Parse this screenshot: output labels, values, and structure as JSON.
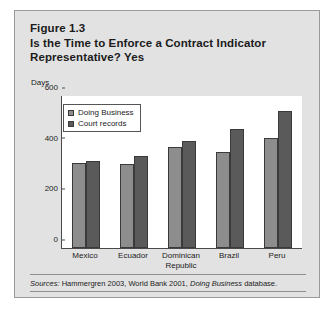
{
  "figure": {
    "title_lines": [
      "Figure 1.3",
      "Is the Time to Enforce a Contract Indicator",
      "Representative? Yes"
    ],
    "unit_label": "Days",
    "source_prefix": "Sources:",
    "source_text_1": " Hammergren 2003, World Bank 2001, ",
    "source_italic": "Doing Business",
    "source_text_2": " database."
  },
  "chart_data": {
    "type": "bar",
    "title": "Is the Time to Enforce a Contract Indicator Representative? Yes",
    "xlabel": "",
    "ylabel": "Days",
    "ylim": [
      0,
      600
    ],
    "yticks": [
      "0",
      "200",
      "400",
      "600"
    ],
    "grid": false,
    "legend_position": "inside-top-left",
    "categories": [
      "Mexico",
      "Ecuador",
      "Dominican Republic",
      "Brazil",
      "Peru"
    ],
    "category_lines": [
      [
        "Mexico"
      ],
      [
        "Ecuador"
      ],
      [
        "Dominican",
        "Republic"
      ],
      [
        "Brazil"
      ],
      [
        "Peru"
      ]
    ],
    "series": [
      {
        "name": "Doing Business",
        "color": "#8d8d8d",
        "values": [
          337,
          333,
          400,
          378,
          435
        ]
      },
      {
        "name": "Court records",
        "color": "#5a5a5a",
        "values": [
          345,
          365,
          422,
          468,
          540
        ]
      }
    ]
  },
  "colors": {
    "card_background": "#e2e2e2",
    "plot_background": "#ffffff",
    "axis": "#4a4a4a",
    "text": "#1b1b1b",
    "series_light": "#8d8d8d",
    "series_dark": "#5a5a5a"
  }
}
